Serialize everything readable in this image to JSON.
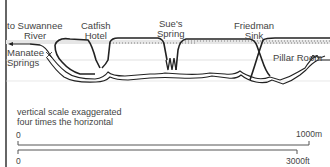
{
  "diagram": {
    "type": "cave-profile",
    "labels": {
      "river": "to Suwannee River",
      "river_line1": "to Suwannee",
      "river_line2": "River",
      "manatee_line1": "Manatee",
      "manatee_line2": "Springs",
      "catfish_line1": "Catfish",
      "catfish_line2": "Hotel",
      "sues_line1": "Sue's",
      "sues_line2": "Spring",
      "friedman_line1": "Friedman",
      "friedman_line2": "Sink",
      "pillar": "Pillar Room"
    },
    "note": {
      "line1": "vertical scale exaggerated",
      "line2": "four times the horizontal"
    },
    "scale_bars": [
      {
        "start": "0",
        "end": "1000m",
        "unit": "metres"
      },
      {
        "start": "0",
        "end": "3000ft",
        "unit": "feet"
      }
    ],
    "colors": {
      "line": "#222222",
      "water_shading": "#e6e6e6",
      "guide": "#bbbbbb"
    }
  }
}
